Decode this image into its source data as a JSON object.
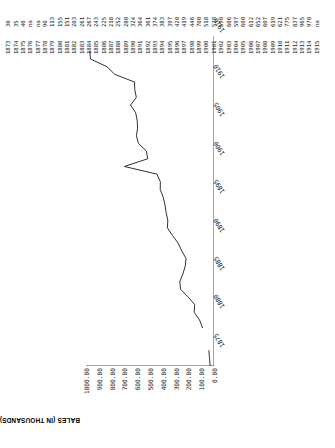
{
  "chart_data": {
    "type": "line",
    "title": "",
    "xlabel": "",
    "ylabel": "BALES (IN THOUSANDS)",
    "ylim": [
      0,
      1000
    ],
    "xlim": [
      1873,
      1916
    ],
    "grid": false,
    "legend": null,
    "rotation": "page rotated 90 degrees counter-clockwise",
    "ytick_labels": [
      "1000.00",
      "900.00",
      "800.00",
      "700.00",
      "600.00",
      "500.00",
      "400.00",
      "300.00",
      "200.00",
      "100.00",
      "0.00"
    ],
    "ytick_values": [
      1000,
      900,
      800,
      700,
      600,
      500,
      400,
      300,
      200,
      100,
      0
    ],
    "xtick_labels": [
      "1875",
      "1880",
      "1885",
      "1890",
      "1895",
      "1900",
      "1905",
      "1910",
      "1916"
    ],
    "xtick_values": [
      1875,
      1880,
      1885,
      1890,
      1895,
      1900,
      1905,
      1910,
      1916
    ],
    "x": [
      1873,
      1874,
      1875,
      1876,
      1877,
      1878,
      1879,
      1880,
      1881,
      1882,
      1883,
      1884,
      1885,
      1886,
      1887,
      1888,
      1889,
      1890,
      1891,
      1892,
      1893,
      1894,
      1895,
      1896,
      1897,
      1898,
      1899,
      1900,
      1901,
      1902,
      1903,
      1904,
      1905,
      1906,
      1907,
      1908,
      1909,
      1910,
      1911,
      1912,
      1913,
      1914,
      1915
    ],
    "values": [
      30,
      35,
      40,
      null,
      null,
      90,
      113,
      155,
      151,
      203,
      261,
      267,
      243,
      225,
      218,
      252,
      280,
      324,
      364,
      361,
      374,
      383,
      397,
      420,
      419,
      446,
      700,
      518,
      528,
      590,
      606,
      597,
      600,
      612,
      652,
      607,
      619,
      621,
      775,
      837,
      965,
      970,
      null
    ]
  },
  "table": {
    "value_row_label": "",
    "year_row_label": "",
    "years": [
      "1873",
      "1874",
      "1875",
      "1876",
      "1877",
      "1878",
      "1879",
      "1880",
      "1881",
      "1882",
      "1883",
      "1884",
      "1885",
      "1886",
      "1887",
      "1888",
      "1889",
      "1890",
      "1891",
      "1892",
      "1893",
      "1894",
      "1895",
      "1896",
      "1897",
      "1898",
      "1899",
      "1900",
      "1901",
      "1902",
      "1903",
      "1904",
      "1905",
      "1906",
      "1907",
      "1908",
      "1909",
      "1910",
      "1911",
      "1912",
      "1913",
      "1914",
      "1915"
    ],
    "values": [
      "30",
      "35",
      "40",
      "na",
      "na",
      "90",
      "113",
      "155",
      "151",
      "203",
      "261",
      "267",
      "243",
      "225",
      "218",
      "252",
      "280",
      "324",
      "364",
      "361",
      "374",
      "383",
      "397",
      "420",
      "419",
      "446",
      "700",
      "518",
      "528",
      "590",
      "606",
      "597",
      "600",
      "612",
      "652",
      "607",
      "619",
      "621",
      "775",
      "837",
      "965",
      "970",
      "na"
    ]
  },
  "axis": {
    "y_title": "BALES (IN THOUSANDS)",
    "origin_label": "0.00"
  },
  "colors": {
    "line": "#1a1a1a",
    "text": "#111111",
    "background": "#ffffff"
  }
}
